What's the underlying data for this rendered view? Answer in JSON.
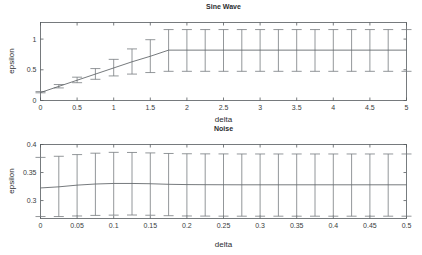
{
  "figure": {
    "width": 422,
    "height": 255,
    "background": "#ffffff",
    "line_color": "#5d6266",
    "errorbar_color": "#777c80",
    "axis_color": "#555a5e"
  },
  "charts": [
    {
      "id": "sine-wave",
      "title": "Sine Wave",
      "xlabel": "delta",
      "ylabel": "epsilon"
    },
    {
      "id": "noise",
      "title": "Noise",
      "xlabel": "delta",
      "ylabel": "epsilon"
    }
  ],
  "chart_data": [
    {
      "type": "line",
      "title": "Sine Wave",
      "xlabel": "delta",
      "ylabel": "epsilon",
      "xlim": [
        0,
        5
      ],
      "ylim": [
        0,
        1.27
      ],
      "xticks": [
        0,
        0.5,
        1,
        1.5,
        2,
        2.5,
        3,
        3.5,
        4,
        4.5,
        5
      ],
      "xticklabels": [
        "0",
        "0.5",
        "1",
        "1.5",
        "2",
        "2.5",
        "3",
        "3.5",
        "4",
        "4.5",
        "5"
      ],
      "yticks": [
        0,
        0.5,
        1
      ],
      "yticklabels": [
        "0",
        "0.5",
        "1"
      ],
      "grid": false,
      "legend": "none",
      "series": [
        {
          "name": "mean",
          "x": [
            0,
            0.25,
            0.5,
            0.75,
            1,
            1.25,
            1.5,
            1.75,
            2,
            2.25,
            2.5,
            2.75,
            3,
            3.25,
            3.5,
            3.75,
            4,
            4.25,
            4.5,
            4.75,
            5
          ],
          "y": [
            0.13,
            0.23,
            0.33,
            0.43,
            0.53,
            0.63,
            0.72,
            0.82,
            0.82,
            0.82,
            0.82,
            0.82,
            0.82,
            0.82,
            0.82,
            0.82,
            0.82,
            0.82,
            0.82,
            0.82,
            0.82
          ],
          "yerr_lower": [
            0.125,
            0.205,
            0.29,
            0.345,
            0.4,
            0.43,
            0.455,
            0.475,
            0.475,
            0.475,
            0.475,
            0.475,
            0.475,
            0.475,
            0.475,
            0.475,
            0.475,
            0.475,
            0.475,
            0.475,
            0.475
          ],
          "yerr_upper": [
            0.145,
            0.26,
            0.38,
            0.52,
            0.67,
            0.84,
            0.99,
            1.155,
            1.155,
            1.155,
            1.155,
            1.155,
            1.155,
            1.155,
            1.155,
            1.155,
            1.155,
            1.155,
            1.155,
            1.155,
            1.155
          ]
        }
      ]
    },
    {
      "type": "line",
      "title": "Noise",
      "xlabel": "delta",
      "ylabel": "epsilon",
      "xlim": [
        0,
        0.5
      ],
      "ylim": [
        0.268,
        0.4
      ],
      "xticks": [
        0,
        0.05,
        0.1,
        0.15,
        0.2,
        0.25,
        0.3,
        0.35,
        0.4,
        0.45,
        0.5
      ],
      "xticklabels": [
        "0",
        "0.05",
        "0.1",
        "0.15",
        "0.2",
        "0.25",
        "0.3",
        "0.35",
        "0.4",
        "0.45",
        "0.5"
      ],
      "yticks": [
        0.3,
        0.35,
        0.4
      ],
      "yticklabels": [
        "0.3",
        "0.35",
        "0.4"
      ],
      "grid": false,
      "legend": "none",
      "series": [
        {
          "name": "mean",
          "x": [
            0,
            0.025,
            0.05,
            0.075,
            0.1,
            0.125,
            0.15,
            0.175,
            0.2,
            0.225,
            0.25,
            0.275,
            0.3,
            0.325,
            0.35,
            0.375,
            0.4,
            0.425,
            0.45,
            0.475,
            0.5
          ],
          "y": [
            0.3225,
            0.3245,
            0.3275,
            0.3295,
            0.3305,
            0.3305,
            0.33,
            0.329,
            0.3285,
            0.3283,
            0.3282,
            0.3281,
            0.3281,
            0.3281,
            0.3281,
            0.3281,
            0.3281,
            0.3281,
            0.3281,
            0.3281,
            0.3281
          ],
          "yerr_lower": [
            0.2715,
            0.2715,
            0.2725,
            0.2735,
            0.274,
            0.2742,
            0.2738,
            0.273,
            0.2725,
            0.2723,
            0.2722,
            0.2721,
            0.2721,
            0.2721,
            0.2721,
            0.2721,
            0.2721,
            0.2721,
            0.2721,
            0.2721,
            0.2721
          ],
          "yerr_upper": [
            0.377,
            0.379,
            0.382,
            0.3845,
            0.386,
            0.3858,
            0.385,
            0.384,
            0.3835,
            0.3833,
            0.3832,
            0.3831,
            0.3831,
            0.3831,
            0.3831,
            0.3831,
            0.3831,
            0.3831,
            0.3831,
            0.3831,
            0.3831
          ]
        }
      ]
    }
  ]
}
